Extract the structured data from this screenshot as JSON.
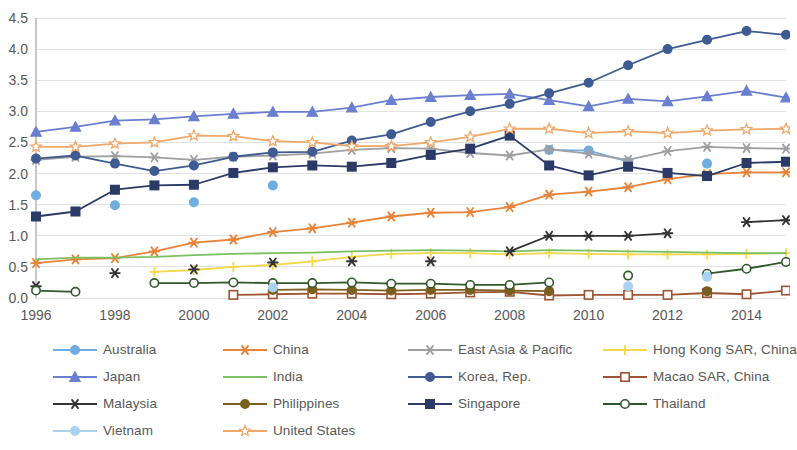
{
  "chart_data": {
    "type": "line",
    "title": "",
    "subtitle": "",
    "xlabel": "",
    "ylabel": "",
    "xlim": [
      1996,
      2015
    ],
    "ylim": [
      0.0,
      4.5
    ],
    "grid": true,
    "legend_position": "bottom",
    "x": [
      1996,
      1997,
      1998,
      1999,
      2000,
      2001,
      2002,
      2003,
      2004,
      2005,
      2006,
      2007,
      2008,
      2009,
      2010,
      2011,
      2012,
      2013,
      2014,
      2015
    ],
    "ytick_labels": [
      "0.0",
      "0.5",
      "1.0",
      "1.5",
      "2.0",
      "2.5",
      "3.0",
      "3.5",
      "4.0",
      "4.5"
    ],
    "ytick_values": [
      0.0,
      0.5,
      1.0,
      1.5,
      2.0,
      2.5,
      3.0,
      3.5,
      4.0,
      4.5
    ],
    "xtick_labels": [
      "1996",
      "1998",
      "2000",
      "2002",
      "2004",
      "2006",
      "2008",
      "2010",
      "2012",
      "2014"
    ],
    "xtick_values": [
      1996,
      1998,
      2000,
      2002,
      2004,
      2006,
      2008,
      2010,
      2012,
      2014
    ],
    "series": [
      {
        "name": "Australia",
        "color": "#70ade0",
        "marker": "circle",
        "marker_filled": true,
        "line": true,
        "values": [
          1.65,
          null,
          1.49,
          null,
          1.54,
          null,
          1.81,
          null,
          null,
          null,
          null,
          null,
          null,
          2.38,
          2.37,
          2.19,
          null,
          2.16,
          null,
          null
        ]
      },
      {
        "name": "China",
        "color": "#e8833a",
        "marker": "asterisk",
        "marker_filled": true,
        "line": true,
        "values": [
          0.56,
          0.62,
          0.64,
          0.75,
          0.89,
          0.94,
          1.06,
          1.12,
          1.21,
          1.31,
          1.37,
          1.38,
          1.46,
          1.66,
          1.71,
          1.78,
          1.91,
          1.99,
          2.02,
          2.02
        ]
      },
      {
        "name": "East Asia & Pacific",
        "color": "#a0a0a4",
        "marker": "asterisk",
        "marker_filled": true,
        "line": true,
        "values": [
          2.22,
          2.27,
          2.28,
          2.26,
          2.22,
          2.27,
          2.29,
          2.32,
          2.38,
          2.41,
          2.4,
          2.33,
          2.29,
          2.39,
          2.32,
          2.22,
          2.36,
          2.43,
          2.41,
          2.4
        ]
      },
      {
        "name": "Hong Kong SAR, China",
        "color": "#f4d74a",
        "marker": "plus",
        "marker_filled": true,
        "line": true,
        "values": [
          null,
          null,
          null,
          0.42,
          0.45,
          0.5,
          0.53,
          0.59,
          0.66,
          0.71,
          0.72,
          0.72,
          0.7,
          0.72,
          0.71,
          0.7,
          0.7,
          0.7,
          0.71,
          0.72
        ]
      },
      {
        "name": "Japan",
        "color": "#6a7fd0",
        "marker": "triangle",
        "marker_filled": true,
        "line": true,
        "values": [
          2.67,
          2.75,
          2.85,
          2.87,
          2.92,
          2.96,
          2.99,
          2.99,
          3.06,
          3.18,
          3.23,
          3.26,
          3.28,
          3.18,
          3.08,
          3.2,
          3.16,
          3.24,
          3.33,
          3.22
        ]
      },
      {
        "name": "India",
        "color": "#79c163",
        "marker": "none",
        "marker_filled": false,
        "line": true,
        "values": [
          0.62,
          0.65,
          0.65,
          0.66,
          0.69,
          0.71,
          0.72,
          0.73,
          0.75,
          0.76,
          0.77,
          0.76,
          0.75,
          0.77,
          0.76,
          0.75,
          0.74,
          0.73,
          0.72,
          0.72
        ]
      },
      {
        "name": "Korea, Rep.",
        "color": "#3e5b92",
        "marker": "circle",
        "marker_filled": true,
        "line": true,
        "values": [
          2.24,
          2.29,
          2.16,
          2.04,
          2.13,
          2.27,
          2.34,
          2.35,
          2.53,
          2.63,
          2.83,
          3.0,
          3.12,
          3.29,
          3.46,
          3.74,
          4.0,
          4.15,
          4.29,
          4.23
        ]
      },
      {
        "name": "Macao SAR, China",
        "color": "#9e5331",
        "marker": "square",
        "marker_filled": false,
        "line": true,
        "values": [
          null,
          null,
          null,
          null,
          null,
          0.05,
          0.06,
          0.07,
          0.07,
          0.06,
          0.07,
          0.09,
          0.1,
          0.04,
          0.05,
          0.05,
          0.05,
          0.08,
          0.06,
          0.12
        ]
      },
      {
        "name": "Malaysia",
        "color": "#333333",
        "marker": "asterisk",
        "marker_filled": true,
        "line": true,
        "values": [
          0.19,
          null,
          0.4,
          null,
          0.46,
          null,
          0.57,
          null,
          0.59,
          null,
          0.59,
          null,
          0.75,
          1.0,
          1.0,
          1.0,
          1.04,
          null,
          1.22,
          1.25
        ]
      },
      {
        "name": "Philippines",
        "color": "#7a5f1e",
        "marker": "circle",
        "marker_filled": true,
        "line": true,
        "values": [
          null,
          null,
          null,
          null,
          null,
          null,
          0.13,
          0.14,
          0.13,
          0.12,
          0.13,
          0.13,
          0.12,
          0.11,
          null,
          null,
          null,
          0.11,
          null,
          null
        ]
      },
      {
        "name": "Singapore",
        "color": "#2b3a66",
        "marker": "square",
        "marker_filled": true,
        "line": true,
        "values": [
          1.31,
          1.39,
          1.74,
          1.81,
          1.82,
          2.01,
          2.1,
          2.13,
          2.11,
          2.17,
          2.3,
          2.4,
          2.61,
          2.13,
          1.97,
          2.11,
          2.01,
          1.96,
          2.17,
          2.19
        ]
      },
      {
        "name": "Thailand",
        "color": "#31582c",
        "marker": "circle",
        "marker_filled": false,
        "line": true,
        "values": [
          0.12,
          0.1,
          null,
          0.24,
          0.24,
          0.25,
          0.24,
          0.24,
          0.25,
          0.23,
          0.23,
          0.21,
          0.21,
          0.25,
          null,
          0.36,
          null,
          0.39,
          0.47,
          0.58
        ]
      },
      {
        "name": "Vietnam",
        "color": "#a9d2f0",
        "marker": "circle",
        "marker_filled": true,
        "line": true,
        "values": [
          null,
          null,
          null,
          null,
          null,
          null,
          0.17,
          null,
          null,
          null,
          null,
          null,
          null,
          null,
          null,
          0.19,
          null,
          0.34,
          null,
          null
        ]
      },
      {
        "name": "United States",
        "color": "#f0a86a",
        "marker": "star",
        "marker_filled": false,
        "line": true,
        "values": [
          2.43,
          2.43,
          2.48,
          2.5,
          2.61,
          2.6,
          2.52,
          2.5,
          2.44,
          2.44,
          2.5,
          2.59,
          2.72,
          2.72,
          2.65,
          2.68,
          2.65,
          2.69,
          2.71,
          2.72
        ]
      }
    ]
  },
  "legend": {
    "items": [
      {
        "label": "Australia",
        "color": "#70ade0",
        "marker": "circle",
        "marker_filled": true
      },
      {
        "label": "China",
        "color": "#e8833a",
        "marker": "asterisk",
        "marker_filled": true
      },
      {
        "label": "East Asia & Pacific",
        "color": "#a0a0a4",
        "marker": "asterisk",
        "marker_filled": true
      },
      {
        "label": "Hong Kong SAR, China",
        "color": "#f4d74a",
        "marker": "plus",
        "marker_filled": true
      },
      {
        "label": "Japan",
        "color": "#6a7fd0",
        "marker": "triangle",
        "marker_filled": true
      },
      {
        "label": "India",
        "color": "#79c163",
        "marker": "none",
        "marker_filled": false
      },
      {
        "label": "Korea, Rep.",
        "color": "#3e5b92",
        "marker": "circle",
        "marker_filled": true
      },
      {
        "label": "Macao SAR, China",
        "color": "#9e5331",
        "marker": "square",
        "marker_filled": false
      },
      {
        "label": "Malaysia",
        "color": "#333333",
        "marker": "asterisk",
        "marker_filled": true
      },
      {
        "label": "Philippines",
        "color": "#7a5f1e",
        "marker": "circle",
        "marker_filled": true
      },
      {
        "label": "Singapore",
        "color": "#2b3a66",
        "marker": "square",
        "marker_filled": true
      },
      {
        "label": "Thailand",
        "color": "#31582c",
        "marker": "circle",
        "marker_filled": false
      },
      {
        "label": "Vietnam",
        "color": "#a9d2f0",
        "marker": "circle",
        "marker_filled": true
      },
      {
        "label": "United States",
        "color": "#f0a86a",
        "marker": "star",
        "marker_filled": false
      }
    ]
  }
}
